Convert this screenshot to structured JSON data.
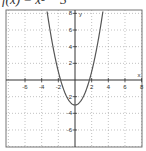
{
  "title": "f(x) = x² − 3",
  "chart_data": {
    "type": "line",
    "title": "f(x) = x² − 3",
    "function": "x^2 - 3",
    "xlabel": "x",
    "ylabel": "y",
    "xlim": [
      -9,
      8
    ],
    "ylim": [
      -8,
      8.5
    ],
    "x_ticks": [
      -6,
      -4,
      -2,
      2,
      4,
      6,
      8
    ],
    "y_ticks": [
      -6,
      -4,
      -2,
      2,
      4,
      6,
      8
    ],
    "grid": true,
    "grid_style": "dotted",
    "series": [
      {
        "name": "f(x)",
        "x": [
          -3.3,
          -3,
          -2,
          -1.73,
          -1,
          0,
          1,
          1.73,
          2,
          3,
          3.3
        ],
        "y": [
          7.89,
          6,
          1,
          0,
          -2,
          -3,
          -2,
          0,
          1,
          6,
          7.89
        ]
      }
    ],
    "vertex": [
      0,
      -3
    ],
    "x_intercepts": [
      -1.73,
      1.73
    ]
  },
  "colors": {
    "curve": "#555555",
    "axis": "#333333",
    "grid": "#999999",
    "frame": "#777777"
  }
}
